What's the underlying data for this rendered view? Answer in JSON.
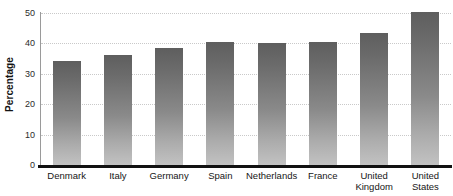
{
  "chart_data": {
    "type": "bar",
    "title": "",
    "subtitle": "",
    "xlabel": "",
    "ylabel": "Percentage",
    "ylim": [
      0,
      50
    ],
    "yticks": [
      0,
      10,
      20,
      30,
      40,
      50
    ],
    "ytick_labels": [
      "0",
      "10",
      "20",
      "30",
      "40",
      "50"
    ],
    "grid": true,
    "grid_axis": "y",
    "legend": false,
    "legend_position": "none",
    "orientation": "vertical",
    "categories": [
      "Denmark",
      "Italy",
      "Germany",
      "Spain",
      "Netherlands",
      "France",
      "United Kingdom",
      "United States"
    ],
    "category_labels": [
      "Denmark",
      "Italy",
      "Germany",
      "Spain",
      "Netherlands",
      "France",
      "United\nKingdom",
      "United\nStates"
    ],
    "values": [
      34.3,
      36.3,
      38.5,
      40.5,
      40.3,
      40.5,
      43.3,
      50.3
    ],
    "series": [
      {
        "name": "Percentage",
        "values": [
          34.3,
          36.3,
          38.5,
          40.5,
          40.3,
          40.5,
          43.3,
          50.3
        ]
      }
    ],
    "colors": {
      "bar_top": "#5e5e5e",
      "bar_bottom": "#c2c2c2",
      "gridline": "#c9c9c9",
      "axis_spine": "#9a9a9a",
      "baseline": "#111111",
      "background": "#ffffff",
      "text": "#161616"
    }
  }
}
